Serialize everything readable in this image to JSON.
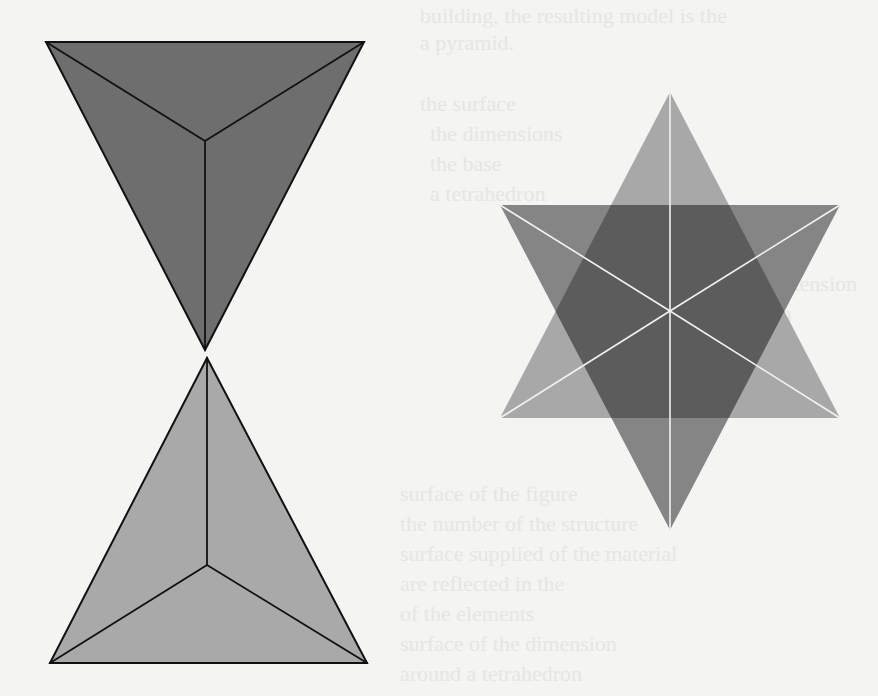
{
  "page": {
    "background_color": "#f4f4f2"
  },
  "ghost_text": {
    "lines": [
      {
        "text": "building, the resulting model is the",
        "x": 420,
        "y": 2
      },
      {
        "text": "a pyramid.",
        "x": 420,
        "y": 29
      },
      {
        "text": "the surface",
        "x": 420,
        "y": 90
      },
      {
        "text": "the dimensions",
        "x": 430,
        "y": 120
      },
      {
        "text": "the base",
        "x": 430,
        "y": 150
      },
      {
        "text": "a tetrahedron",
        "x": 430,
        "y": 180
      },
      {
        "text": "rational extension",
        "x": 700,
        "y": 270
      },
      {
        "text": "dimension",
        "x": 700,
        "y": 300
      },
      {
        "text": "an equation",
        "x": 700,
        "y": 350
      },
      {
        "text": "surface of the figure",
        "x": 400,
        "y": 480
      },
      {
        "text": "the number of the structure",
        "x": 400,
        "y": 510
      },
      {
        "text": "surface supplied of the material",
        "x": 400,
        "y": 540
      },
      {
        "text": "are reflected in the",
        "x": 400,
        "y": 570
      },
      {
        "text": "of the elements",
        "x": 400,
        "y": 600
      },
      {
        "text": "surface of the dimension",
        "x": 400,
        "y": 630
      },
      {
        "text": "around a tetrahedron",
        "x": 400,
        "y": 660
      }
    ]
  },
  "left_figure": {
    "name": "double-tetrahedron",
    "top_tetrahedron": {
      "orientation": "apex-down",
      "vertices": [
        [
          46,
          42
        ],
        [
          364,
          42
        ],
        [
          205,
          350
        ]
      ],
      "center": [
        205,
        141
      ],
      "fill": "#6e6e6e",
      "edge_color": "#111111"
    },
    "bottom_tetrahedron": {
      "orientation": "apex-up",
      "vertices": [
        [
          207,
          358
        ],
        [
          50,
          663
        ],
        [
          367,
          663
        ]
      ],
      "center": [
        207,
        565
      ],
      "fill": "#a9a9a9",
      "edge_color": "#111111"
    }
  },
  "right_figure": {
    "name": "star-tetrahedron",
    "center": [
      670,
      311
    ],
    "upward_triangle": {
      "vertices": [
        [
          670,
          92
        ],
        [
          500,
          418
        ],
        [
          840,
          418
        ]
      ],
      "fill": "#a8a8a8"
    },
    "downward_triangle": {
      "vertices": [
        [
          500,
          205
        ],
        [
          840,
          205
        ],
        [
          670,
          530
        ]
      ],
      "fill": "#858585"
    },
    "overlap_fill": "#5c5c5c",
    "spoke_color": "#f2f2f2"
  }
}
